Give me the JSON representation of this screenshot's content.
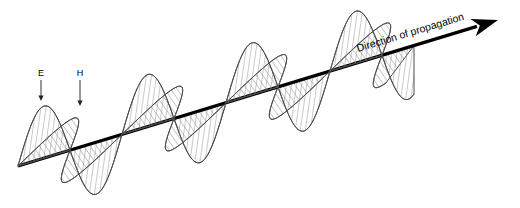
{
  "figure": {
    "width": 520,
    "height": 208,
    "background": "#ffffff"
  },
  "chart_data": {
    "type": "line",
    "xlabel": "",
    "ylabel": "",
    "grid": false,
    "legend": "none",
    "axis": {
      "name": "Direction of propagation",
      "start": [
        18,
        166
      ],
      "end": [
        498,
        20
      ],
      "slope_deg": -16.9,
      "color": "#000000",
      "width": 3.2,
      "arrowhead": {
        "shape": "solid-triangle-notched",
        "length": 26,
        "half_width": 9,
        "notch": 7,
        "color": "#000000"
      }
    },
    "waves": [
      {
        "name": "E",
        "label": "E",
        "field": "electric",
        "plane": "vertical",
        "hatch": "vertical",
        "hatch_angle_deg": 82,
        "hatch_spacing": 5,
        "hatch_color": "#8a8a8a",
        "outline_color": "#4d4d4d",
        "amplitude": 52,
        "wavelength": 104,
        "phase_deg": 0,
        "x_start": 18,
        "x_end": 414,
        "crests": [
          44,
          148,
          252,
          356
        ],
        "troughs": [
          96,
          200,
          304,
          408
        ],
        "zero_crossings": [
          18,
          70,
          122,
          174,
          226,
          278,
          330,
          382,
          414
        ]
      },
      {
        "name": "H",
        "label": "H",
        "field": "magnetic",
        "plane": "horizontal-oblique",
        "hatch": "diagonal",
        "hatch_angle_deg": 35,
        "hatch_spacing": 5,
        "hatch_color": "#8a8a8a",
        "outline_color": "#4d4d4d",
        "amplitude": 40,
        "skew_x": 30,
        "wavelength": 104,
        "phase_deg": 0,
        "x_start": 18,
        "x_end": 414,
        "crests": [
          44,
          148,
          252,
          356
        ],
        "troughs": [
          96,
          200,
          304,
          408
        ],
        "zero_crossings": [
          18,
          70,
          122,
          174,
          226,
          278,
          330,
          382,
          414
        ]
      }
    ],
    "annotations": [
      {
        "id": "e-label",
        "text": "E",
        "x": 41,
        "y": 76,
        "pointer_from": [
          41,
          80
        ],
        "pointer_to": [
          41,
          101
        ],
        "pointer": "down-arrow"
      },
      {
        "id": "h-label",
        "text": "H",
        "x": 80,
        "y": 76,
        "pointer_from": [
          80,
          80
        ],
        "pointer_to": [
          80,
          106
        ],
        "pointer": "down-arrow"
      },
      {
        "id": "direction-label",
        "text": "Direction of propagation",
        "x": 358,
        "y": 52,
        "rotation_deg": -16.9
      }
    ]
  },
  "labels": {
    "e_field": "E",
    "h_field": "H",
    "direction": "Direction of propagation"
  }
}
